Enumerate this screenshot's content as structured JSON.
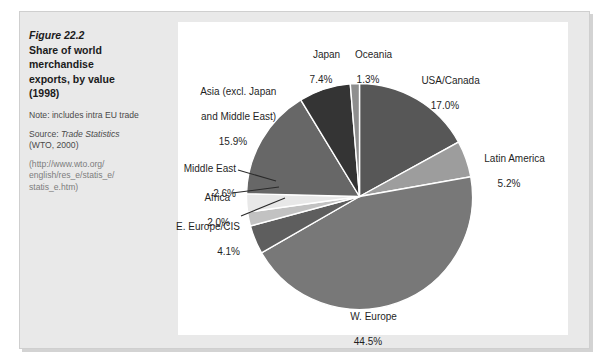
{
  "figure": {
    "number_label": "Figure 22.2",
    "title_line1": "Share of world",
    "title_line2": "merchandise",
    "title_line3": "exports, by value",
    "title_line4": "(1998)",
    "note_label": "Note: includes intra EU",
    "note_line2": "trade",
    "source_prefix": "Source: ",
    "source_italic": "Trade Statistics",
    "source_line2": "(WTO, 2000)",
    "url_line1": "(http://www.wto.org/",
    "url_line2": "english/res_e/statis_e/",
    "url_line3": "statis_e.htm)"
  },
  "chart_data": {
    "type": "pie",
    "title": "Share of world merchandise exports, by value (1998)",
    "unit": "%",
    "legend_position": "callout-labels",
    "categories": [
      "USA/Canada",
      "Latin America",
      "W. Europe",
      "E. Europe/CIS",
      "Africa",
      "Middle East",
      "Asia (excl. Japan and Middle East)",
      "Japan",
      "Oceania"
    ],
    "values": [
      17.0,
      5.2,
      44.5,
      4.1,
      2.0,
      2.6,
      15.9,
      7.4,
      1.3
    ],
    "slices": [
      {
        "name": "USA/Canada",
        "label_line1": "USA/Canada",
        "value": 17.0,
        "value_text": "17.0%",
        "color": "#575757",
        "start_deg": 4.7,
        "sweep_deg": 61.2
      },
      {
        "name": "Latin America",
        "label_line1": "Latin America",
        "value": 5.2,
        "value_text": "5.2%",
        "color": "#9d9d9d",
        "start_deg": 65.9,
        "sweep_deg": 18.7
      },
      {
        "name": "W. Europe",
        "label_line1": "W. Europe",
        "value": 44.5,
        "value_text": "44.5%",
        "color": "#787878",
        "start_deg": 84.6,
        "sweep_deg": 160.2
      },
      {
        "name": "E. Europe/CIS",
        "label_line1": "E. Europe/CIS",
        "value": 4.1,
        "value_text": "4.1%",
        "color": "#5e5e5e",
        "start_deg": 244.8,
        "sweep_deg": 14.8
      },
      {
        "name": "Africa",
        "label_line1": "Africa",
        "value": 2.0,
        "value_text": "2.0%",
        "color": "#c2c2c2",
        "start_deg": 259.6,
        "sweep_deg": 7.2
      },
      {
        "name": "Middle East",
        "label_line1": "Middle East",
        "value": 2.6,
        "value_text": "2.6%",
        "color": "#e8e8e8",
        "start_deg": 266.8,
        "sweep_deg": 9.4
      },
      {
        "name": "Asia (excl. Japan and Middle East)",
        "label_line1": "Asia (excl. Japan",
        "label_line2": "and Middle East)",
        "value": 15.9,
        "value_text": "15.9%",
        "color": "#676767",
        "start_deg": 276.2,
        "sweep_deg": 57.2
      },
      {
        "name": "Japan",
        "label_line1": "Japan",
        "value": 7.4,
        "value_text": "7.4%",
        "color": "#343434",
        "start_deg": 333.4,
        "sweep_deg": 26.6
      },
      {
        "name": "Oceania",
        "label_line1": "Oceania",
        "value": 1.3,
        "value_text": "1.3%",
        "color": "#8e8e8e",
        "start_deg": 0.0,
        "sweep_deg": 4.7
      }
    ]
  }
}
